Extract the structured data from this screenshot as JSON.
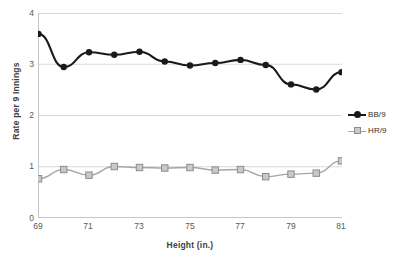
{
  "chart_data": {
    "type": "line",
    "title": "",
    "subtitle": "",
    "xlabel": "Height (in.)",
    "ylabel": "Rate per 9 Innings",
    "x": [
      69,
      70,
      71,
      72,
      73,
      74,
      75,
      76,
      77,
      78,
      79,
      80,
      81
    ],
    "xlim": [
      69,
      81
    ],
    "ylim": [
      0,
      4
    ],
    "x_tick_labels": [
      "69",
      "71",
      "73",
      "75",
      "77",
      "79",
      "81"
    ],
    "x_tick_values": [
      69,
      71,
      73,
      75,
      77,
      79,
      81
    ],
    "y_tick_labels": [
      "0",
      "1",
      "2",
      "3",
      "4"
    ],
    "y_tick_values": [
      0,
      1,
      2,
      3,
      4
    ],
    "grid": "horizontal",
    "legend_position": "right",
    "series": [
      {
        "name": "BB/9",
        "color": "#1a1a1a",
        "marker": "circle",
        "values": [
          3.6,
          2.95,
          3.24,
          3.19,
          3.25,
          3.06,
          2.98,
          3.03,
          3.09,
          2.99,
          2.61,
          2.51,
          2.85
        ]
      },
      {
        "name": "HR/9",
        "color": "#a6a6a6",
        "marker": "square",
        "values": [
          0.76,
          0.94,
          0.83,
          1.0,
          0.98,
          0.97,
          0.98,
          0.93,
          0.94,
          0.8,
          0.85,
          0.87,
          1.11
        ]
      }
    ]
  },
  "axes": {
    "y_title": "Rate per 9 Innings",
    "x_title": "Height (in.)",
    "y_labels": [
      "4",
      "3",
      "2",
      "1",
      "0"
    ],
    "x_labels": [
      "69",
      "71",
      "73",
      "75",
      "77",
      "79",
      "81"
    ]
  },
  "legend": {
    "items": [
      {
        "label": "BB/9",
        "color": "#1a1a1a",
        "marker": "circle"
      },
      {
        "label": "HR/9",
        "color": "#a6a6a6",
        "marker": "square"
      }
    ]
  },
  "colors": {
    "series_bb": "#1a1a1a",
    "series_hr": "#a6a6a6",
    "grid": "#d9d9d9",
    "axis": "#bfbfbf",
    "text": "#595959"
  }
}
